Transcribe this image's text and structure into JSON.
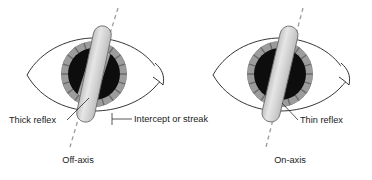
{
  "figure": {
    "background_color": "#ffffff",
    "eyes": [
      {
        "id": "off-axis-eye",
        "caption": "Off-axis",
        "labels": [
          {
            "id": "thick-reflex",
            "text": "Thick reflex"
          },
          {
            "id": "intercept-or-streak",
            "text": "Intercept or streak"
          }
        ]
      },
      {
        "id": "on-axis-eye",
        "caption": "On-axis",
        "labels": [
          {
            "id": "thin-reflex",
            "text": "Thin reflex"
          }
        ]
      }
    ]
  },
  "colors": {
    "pupil": "#0d0d0d",
    "iris_ring": "#9c9c9c",
    "iris_striation": "#6f6f6f",
    "sclera": "#ffffff",
    "outline": "#1f1f1f",
    "beam_fill": "#d4d4d4",
    "beam_stroke": "#6b6b6b",
    "reflex_light": "#f2f2f2",
    "axis_dash": "#9a9a9a",
    "text": "#1a1a1a"
  },
  "text": {
    "thick_reflex": "Thick reflex",
    "intercept_or_streak": "Intercept or streak",
    "thin_reflex": "Thin reflex",
    "off_axis": "Off-axis",
    "on_axis": "On-axis"
  }
}
